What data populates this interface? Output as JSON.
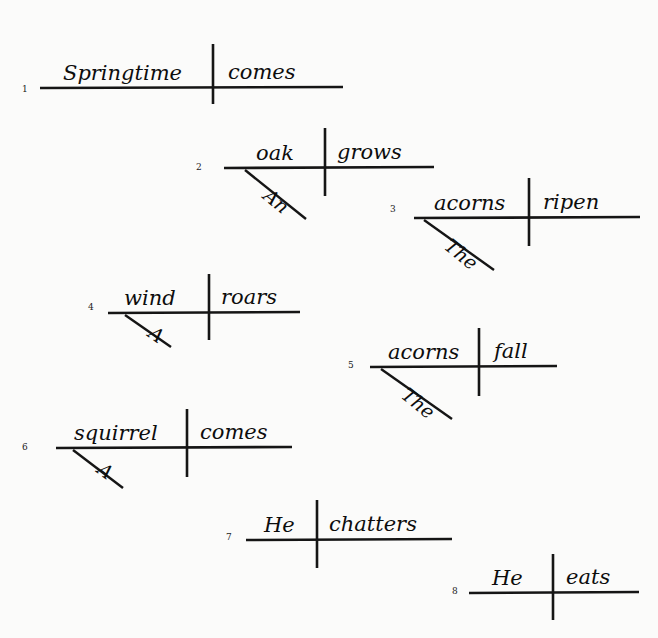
{
  "page": {
    "background_color": "#fbfbfa",
    "ink_color": "#151515",
    "width": 658,
    "height": 638
  },
  "diagrams": [
    {
      "number": "1",
      "subject": "Springtime",
      "verb": "comes",
      "modifier": "",
      "sentence": "Springtime comes.",
      "geometry": {
        "num_x": 22,
        "num_y": 92,
        "base_x1": 40,
        "base_y1": 88,
        "base_x2": 343,
        "base_y2": 87,
        "div_x": 213,
        "div_y1": 44,
        "div_y2": 104,
        "subj_x": 63,
        "subj_y": 80,
        "verb_x": 228,
        "verb_y": 79,
        "has_slant": false,
        "slant_x1": 0,
        "slant_y1": 0,
        "slant_x2": 0,
        "slant_y2": 0,
        "mod_x": 0,
        "mod_y": 0,
        "mod_rot": 0
      }
    },
    {
      "number": "2",
      "subject": "oak",
      "verb": "grows",
      "modifier": "An",
      "sentence": "An oak grows.",
      "geometry": {
        "num_x": 196,
        "num_y": 170,
        "base_x1": 224,
        "base_y1": 168,
        "base_x2": 434,
        "base_y2": 167,
        "div_x": 325,
        "div_y1": 128,
        "div_y2": 196,
        "subj_x": 256,
        "subj_y": 160,
        "verb_x": 337,
        "verb_y": 159,
        "has_slant": true,
        "slant_x1": 245,
        "slant_y1": 170,
        "slant_x2": 306,
        "slant_y2": 219,
        "mod_x": 262,
        "mod_y": 198,
        "mod_rot": 39
      }
    },
    {
      "number": "3",
      "subject": "acorns",
      "verb": "ripen",
      "modifier": "The",
      "sentence": "The acorns ripen.",
      "geometry": {
        "num_x": 390,
        "num_y": 212,
        "base_x1": 414,
        "base_y1": 218,
        "base_x2": 640,
        "base_y2": 217,
        "div_x": 529,
        "div_y1": 178,
        "div_y2": 246,
        "subj_x": 434,
        "subj_y": 210,
        "verb_x": 543,
        "verb_y": 209,
        "has_slant": true,
        "slant_x1": 424,
        "slant_y1": 220,
        "slant_x2": 494,
        "slant_y2": 270,
        "mod_x": 443,
        "mod_y": 248,
        "mod_rot": 39
      }
    },
    {
      "number": "4",
      "subject": "wind",
      "verb": "roars",
      "modifier": "A",
      "sentence": "A wind roars.",
      "geometry": {
        "num_x": 88,
        "num_y": 310,
        "base_x1": 108,
        "base_y1": 313,
        "base_x2": 300,
        "base_y2": 312,
        "div_x": 209,
        "div_y1": 274,
        "div_y2": 340,
        "subj_x": 124,
        "subj_y": 305,
        "verb_x": 221,
        "verb_y": 304,
        "has_slant": true,
        "slant_x1": 125,
        "slant_y1": 315,
        "slant_x2": 171,
        "slant_y2": 347,
        "mod_x": 147,
        "mod_y": 336,
        "mod_rot": 35
      }
    },
    {
      "number": "5",
      "subject": "acorns",
      "verb": "fall",
      "modifier": "The",
      "sentence": "The acorns fall.",
      "geometry": {
        "num_x": 348,
        "num_y": 368,
        "base_x1": 370,
        "base_y1": 367,
        "base_x2": 557,
        "base_y2": 366,
        "div_x": 479,
        "div_y1": 328,
        "div_y2": 396,
        "subj_x": 388,
        "subj_y": 359,
        "verb_x": 494,
        "verb_y": 358,
        "has_slant": true,
        "slant_x1": 381,
        "slant_y1": 369,
        "slant_x2": 452,
        "slant_y2": 419,
        "mod_x": 400,
        "mod_y": 397,
        "mod_rot": 39
      }
    },
    {
      "number": "6",
      "subject": "squirrel",
      "verb": "comes",
      "modifier": "A",
      "sentence": "A squirrel comes.",
      "geometry": {
        "num_x": 22,
        "num_y": 450,
        "base_x1": 56,
        "base_y1": 448,
        "base_x2": 292,
        "base_y2": 447,
        "div_x": 187,
        "div_y1": 409,
        "div_y2": 477,
        "subj_x": 74,
        "subj_y": 440,
        "verb_x": 200,
        "verb_y": 439,
        "has_slant": true,
        "slant_x1": 73,
        "slant_y1": 450,
        "slant_x2": 123,
        "slant_y2": 488,
        "mod_x": 96,
        "mod_y": 472,
        "mod_rot": 37
      }
    },
    {
      "number": "7",
      "subject": "He",
      "verb": "chatters",
      "modifier": "",
      "sentence": "He chatters.",
      "geometry": {
        "num_x": 226,
        "num_y": 540,
        "base_x1": 246,
        "base_y1": 540,
        "base_x2": 452,
        "base_y2": 539,
        "div_x": 317,
        "div_y1": 500,
        "div_y2": 568,
        "subj_x": 264,
        "subj_y": 532,
        "verb_x": 329,
        "verb_y": 531,
        "has_slant": false,
        "slant_x1": 0,
        "slant_y1": 0,
        "slant_x2": 0,
        "slant_y2": 0,
        "mod_x": 0,
        "mod_y": 0,
        "mod_rot": 0
      }
    },
    {
      "number": "8",
      "subject": "He",
      "verb": "eats",
      "modifier": "",
      "sentence": "He eats.",
      "geometry": {
        "num_x": 452,
        "num_y": 594,
        "base_x1": 469,
        "base_y1": 593,
        "base_x2": 639,
        "base_y2": 592,
        "div_x": 553,
        "div_y1": 554,
        "div_y2": 620,
        "subj_x": 492,
        "subj_y": 585,
        "verb_x": 566,
        "verb_y": 584,
        "has_slant": false,
        "slant_x1": 0,
        "slant_y1": 0,
        "slant_x2": 0,
        "slant_y2": 0,
        "mod_x": 0,
        "mod_y": 0,
        "mod_rot": 0
      }
    }
  ]
}
